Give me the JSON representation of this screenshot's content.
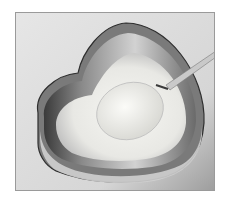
{
  "image": {
    "subject": "heart-shaped cake tin with batter and spoon",
    "colors": {
      "background": "#e2e2e2",
      "frame": "#9a9a9a",
      "tin_dark": "#2e2e2e",
      "tin_light": "#d8d8d8",
      "batter": "#f2f2ee",
      "spoon": "#bdbdbd"
    }
  }
}
